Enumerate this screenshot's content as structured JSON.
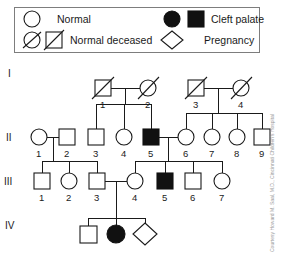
{
  "figure": {
    "type": "pedigree-chart",
    "credit_text": "Courtesy Howard M. Saal, M.D., Cincinnati Children's Hospital"
  },
  "legend": {
    "items": [
      {
        "id": "normal",
        "label": "Normal",
        "shapes": [
          "circle-open"
        ],
        "filled": false,
        "deceased": false
      },
      {
        "id": "normal-deceased",
        "label": "Normal deceased",
        "shapes": [
          "circle-open-slashed",
          "square-open-slashed"
        ],
        "filled": false,
        "deceased": true
      },
      {
        "id": "cleft-palate",
        "label": "Cleft palate",
        "shapes": [
          "circle-filled",
          "square-filled"
        ],
        "filled": true,
        "deceased": false
      },
      {
        "id": "pregnancy",
        "label": "Pregnancy",
        "shapes": [
          "diamond-open"
        ],
        "filled": false,
        "deceased": false
      }
    ]
  },
  "generations": [
    {
      "roman": "I",
      "count": 4
    },
    {
      "roman": "II",
      "count": 9
    },
    {
      "roman": "III",
      "count": 7
    },
    {
      "roman": "IV",
      "count": 3
    }
  ],
  "individuals": [
    {
      "gen": "I",
      "id": "1",
      "sex": "male",
      "shape": "square",
      "affected": false,
      "deceased": true,
      "x": 103,
      "y": 88
    },
    {
      "gen": "I",
      "id": "2",
      "sex": "female",
      "shape": "circle",
      "affected": false,
      "deceased": true,
      "x": 148,
      "y": 88
    },
    {
      "gen": "I",
      "id": "3",
      "sex": "male",
      "shape": "square",
      "affected": false,
      "deceased": true,
      "x": 196,
      "y": 88
    },
    {
      "gen": "I",
      "id": "4",
      "sex": "female",
      "shape": "circle",
      "affected": false,
      "deceased": true,
      "x": 241,
      "y": 88
    },
    {
      "gen": "II",
      "id": "1",
      "sex": "female",
      "shape": "circle",
      "affected": false,
      "deceased": false,
      "x": 39,
      "y": 137
    },
    {
      "gen": "II",
      "id": "2",
      "sex": "male",
      "shape": "square",
      "affected": false,
      "deceased": false,
      "x": 67,
      "y": 137
    },
    {
      "gen": "II",
      "id": "3",
      "sex": "male",
      "shape": "square",
      "affected": false,
      "deceased": false,
      "x": 96,
      "y": 137
    },
    {
      "gen": "II",
      "id": "4",
      "sex": "female",
      "shape": "circle",
      "affected": false,
      "deceased": false,
      "x": 124,
      "y": 137
    },
    {
      "gen": "II",
      "id": "5",
      "sex": "male",
      "shape": "square",
      "affected": true,
      "deceased": false,
      "x": 151,
      "y": 137
    },
    {
      "gen": "II",
      "id": "6",
      "sex": "female",
      "shape": "circle",
      "affected": false,
      "deceased": false,
      "x": 186,
      "y": 137
    },
    {
      "gen": "II",
      "id": "7",
      "sex": "female",
      "shape": "circle",
      "affected": false,
      "deceased": false,
      "x": 212,
      "y": 137
    },
    {
      "gen": "II",
      "id": "8",
      "sex": "female",
      "shape": "circle",
      "affected": false,
      "deceased": false,
      "x": 237,
      "y": 137
    },
    {
      "gen": "II",
      "id": "9",
      "sex": "male",
      "shape": "square",
      "affected": false,
      "deceased": false,
      "x": 262,
      "y": 137
    },
    {
      "gen": "III",
      "id": "1",
      "sex": "male",
      "shape": "square",
      "affected": false,
      "deceased": false,
      "x": 42,
      "y": 181
    },
    {
      "gen": "III",
      "id": "2",
      "sex": "female",
      "shape": "circle",
      "affected": false,
      "deceased": false,
      "x": 69,
      "y": 181
    },
    {
      "gen": "III",
      "id": "3",
      "sex": "male",
      "shape": "square",
      "affected": false,
      "deceased": false,
      "x": 97,
      "y": 181
    },
    {
      "gen": "III",
      "id": "4",
      "sex": "female",
      "shape": "circle",
      "affected": false,
      "deceased": false,
      "x": 135,
      "y": 181
    },
    {
      "gen": "III",
      "id": "5",
      "sex": "male",
      "shape": "square",
      "affected": true,
      "deceased": false,
      "x": 165,
      "y": 181
    },
    {
      "gen": "III",
      "id": "6",
      "sex": "male",
      "shape": "square",
      "affected": false,
      "deceased": false,
      "x": 193,
      "y": 181
    },
    {
      "gen": "III",
      "id": "7",
      "sex": "female",
      "shape": "circle",
      "affected": false,
      "deceased": false,
      "x": 222,
      "y": 181
    },
    {
      "gen": "IV",
      "id": "",
      "sex": "male",
      "shape": "square",
      "affected": false,
      "deceased": false,
      "x": 88,
      "y": 234
    },
    {
      "gen": "IV",
      "id": "",
      "sex": "female",
      "shape": "circle",
      "affected": true,
      "deceased": false,
      "x": 116,
      "y": 234
    },
    {
      "gen": "IV",
      "id": "",
      "sex": "unknown",
      "shape": "diamond",
      "affected": false,
      "deceased": false,
      "x": 145,
      "y": 234
    }
  ],
  "matings": [
    {
      "partners": [
        "I-1",
        "I-2"
      ],
      "children": [
        "II-3",
        "II-4",
        "II-5"
      ]
    },
    {
      "partners": [
        "I-3",
        "I-4"
      ],
      "children": [
        "II-6",
        "II-7",
        "II-8",
        "II-9"
      ]
    },
    {
      "partners": [
        "II-1",
        "II-2"
      ],
      "children": [
        "III-1",
        "III-2",
        "III-3"
      ]
    },
    {
      "partners": [
        "II-5",
        "II-6"
      ],
      "children": [
        "III-4",
        "III-5",
        "III-6",
        "III-7"
      ]
    },
    {
      "partners": [
        "III-3",
        "III-4"
      ],
      "children": [
        "IV-1",
        "IV-2",
        "IV-3"
      ]
    }
  ],
  "colors": {
    "stroke": "#1a1a1a",
    "fill_affected": "#111111",
    "fill_normal": "#ffffff",
    "legend_border": "#7d7d7d",
    "credit": "#9a9a9a"
  }
}
